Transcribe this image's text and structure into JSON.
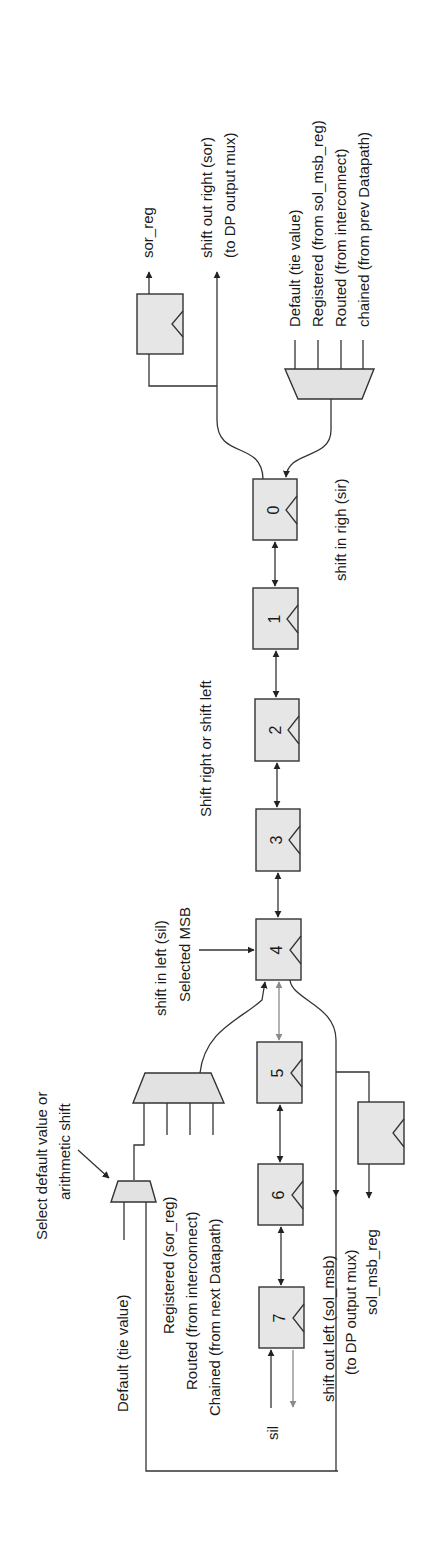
{
  "figure": {
    "registers": [
      {
        "id": "0",
        "label": "0"
      },
      {
        "id": "1",
        "label": "1"
      },
      {
        "id": "2",
        "label": "2"
      },
      {
        "id": "3",
        "label": "3"
      },
      {
        "id": "4",
        "label": "4"
      },
      {
        "id": "5",
        "label": "5"
      },
      {
        "id": "6",
        "label": "6"
      },
      {
        "id": "7",
        "label": "7"
      }
    ],
    "labels": {
      "sor_reg": "sor_reg",
      "sor_line1": "shift out right (sor)",
      "sor_line2": "(to DP output mux)",
      "right_mux_inputs": [
        "Default (tie value)",
        "Registered (from sol_msb_reg)",
        "Routed (from interconnect)",
        "chained (from prev Datapath)"
      ],
      "sir": "shift in righ (sir)",
      "shift_dir": "Shift right or shift left",
      "selected_msb": "Selected MSB",
      "sil_label": "shift in left (sil)",
      "select_default_line1": "Select default value or",
      "select_default_line2": "arithmetic shift",
      "left_default": "Default (tie value)",
      "left_mux_inputs": [
        "Registered (sor_reg)",
        "Routed (from interconnect)",
        "Chained (from next Datapath)"
      ],
      "sil_short": "sil",
      "sol_line1": "shift out left (sol_msb)",
      "sol_line2": "(to DP output mux)",
      "sol_msb_reg": "sol_msb_reg"
    },
    "colors": {
      "register_fill": "#e6e6e6",
      "stroke": "#333333",
      "inactive_arrow": "#8a8a8a"
    }
  }
}
